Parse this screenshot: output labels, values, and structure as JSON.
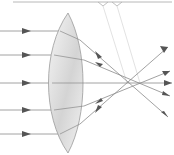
{
  "diagram": {
    "title": "",
    "type": "spherical-aberration-convex-lens",
    "colors": {
      "ray": "#8a8a8a",
      "arrow": "#555555",
      "lens_edge": "#9a9a9a",
      "lens_fill_light": "#f4f4f4",
      "lens_fill_dark": "#d0d0d0",
      "guide": "#c8c8c8",
      "bracket": "#b0b0b0"
    },
    "incident_rays": [
      {
        "y": 31
      },
      {
        "y": 55
      },
      {
        "y": 83
      },
      {
        "y": 110
      },
      {
        "y": 134
      }
    ],
    "focal_points": [
      {
        "label": "",
        "x": 127,
        "y": 83
      },
      {
        "label": "",
        "x": 140,
        "y": 83
      }
    ]
  }
}
